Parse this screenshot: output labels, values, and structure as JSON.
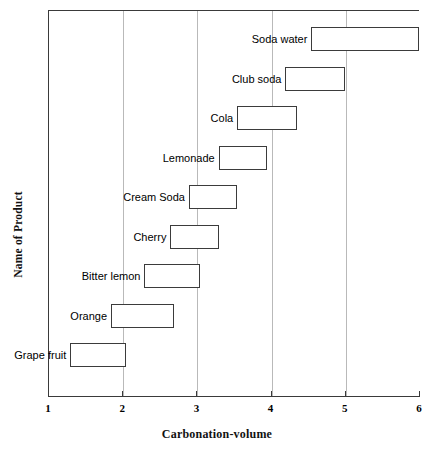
{
  "chart_data": {
    "type": "bar",
    "orientation": "horizontal-range",
    "title": "",
    "xlabel": "Carbonation-volume",
    "ylabel": "Name of Product",
    "xlim": [
      1,
      6
    ],
    "xticks": [
      "1",
      "2",
      "3",
      "4",
      "5",
      "6"
    ],
    "gridlines": [
      2,
      3,
      4,
      5
    ],
    "grid": true,
    "legend": null,
    "categories": [
      "Soda water",
      "Club soda",
      "Cola",
      "Lemonade",
      "Cream Soda",
      "Cherry",
      "Bitter lemon",
      "Orange",
      "Grape fruit"
    ],
    "ranges": [
      {
        "label": "Soda water",
        "start": 4.55,
        "end": 6.0
      },
      {
        "label": "Club soda",
        "start": 4.2,
        "end": 5.0
      },
      {
        "label": "Cola",
        "start": 3.55,
        "end": 4.35
      },
      {
        "label": "Lemonade",
        "start": 3.3,
        "end": 3.95
      },
      {
        "label": "Cream Soda",
        "start": 2.9,
        "end": 3.55
      },
      {
        "label": "Cherry",
        "start": 2.65,
        "end": 3.3
      },
      {
        "label": "Bitter lemon",
        "start": 2.3,
        "end": 3.05
      },
      {
        "label": "Orange",
        "start": 1.85,
        "end": 2.7
      },
      {
        "label": "Grape fruit",
        "start": 1.3,
        "end": 2.05
      }
    ],
    "colors": {
      "bar_fill": "#ffffff",
      "bar_stroke": "#3b3b3b",
      "axis": "#3a3a3a",
      "grid": "#b9b9b9",
      "text": "#000000",
      "background": "#ffffff"
    }
  }
}
